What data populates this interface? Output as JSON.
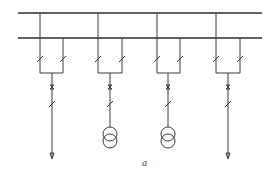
{
  "diagram": {
    "type": "single-line electrical schematic",
    "caption": "a",
    "buses": [
      {
        "name": "busbar-1",
        "y": 13,
        "x1": 18,
        "x2": 262
      },
      {
        "name": "busbar-2",
        "y": 38,
        "x1": 18,
        "x2": 262
      }
    ],
    "bays": [
      {
        "index": 1,
        "left_x": 40,
        "right_x": 63,
        "center_x": 52,
        "load": "outgoing-line-arrow"
      },
      {
        "index": 2,
        "left_x": 98,
        "right_x": 122,
        "center_x": 110,
        "load": "transformer"
      },
      {
        "index": 3,
        "left_x": 157,
        "right_x": 180,
        "center_x": 168,
        "load": "transformer"
      },
      {
        "index": 4,
        "left_x": 216,
        "right_x": 240,
        "center_x": 228,
        "load": "outgoing-line-arrow"
      }
    ],
    "components_per_bay": [
      "bus-disconnector-1",
      "bus-disconnector-2",
      "circuit-breaker",
      "line-disconnector"
    ],
    "colors": {
      "line": "#3a3a3a",
      "background": "#ffffff"
    }
  }
}
